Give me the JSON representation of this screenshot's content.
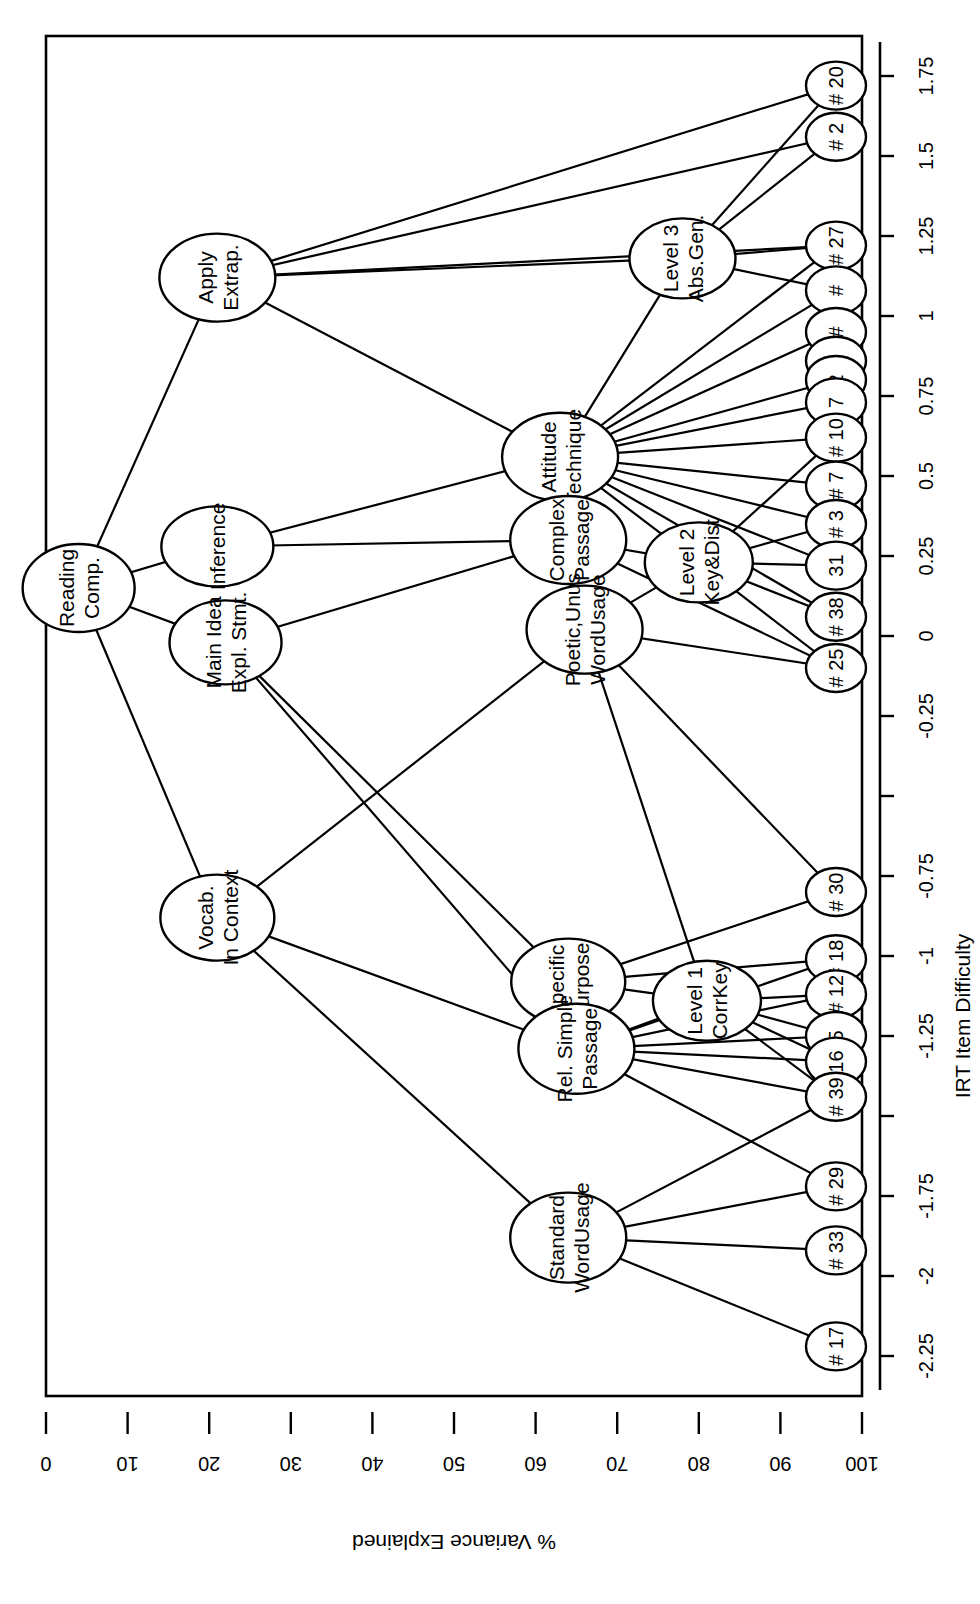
{
  "figure": {
    "orientation": "rotated-90-counterclockwise",
    "background": "#ffffff",
    "ink": "#000000"
  },
  "axes": {
    "x": {
      "label": "IRT Item Difficulty",
      "ticks": [
        "-2.25",
        "-2",
        "-1.75",
        "-1.5",
        "-1.25",
        "-1",
        "-0.75",
        "-0.5",
        "-0.25",
        "0",
        "0.25",
        "0.5",
        "0.75",
        "1",
        "1.25",
        "1.5",
        "1.75"
      ],
      "tick_labels_shown": [
        "-2.25",
        "-2",
        "-1.75",
        "-1.25",
        "-1",
        "-0.75",
        "-0.25",
        "0",
        "0.25",
        "0.5",
        "0.75",
        "1",
        "1.25",
        "1.5",
        "1.75"
      ],
      "min": -2.375,
      "max": 1.875
    },
    "y": {
      "label": "% Variance Explained",
      "ticks": [
        "0",
        "10",
        "20",
        "30",
        "40",
        "50",
        "60",
        "70",
        "80",
        "90",
        "100"
      ],
      "min": 0,
      "max": 100
    }
  },
  "chart_data": {
    "type": "diagram",
    "title": "",
    "xlabel": "IRT Item Difficulty",
    "ylabel": "% Variance Explained",
    "xlim": [
      -2.375,
      1.875
    ],
    "ylim": [
      0,
      100
    ],
    "grid": false,
    "legend": null,
    "nodes": [
      {
        "id": "root",
        "label": "Reading Comp.",
        "line1": "Reading",
        "line2": "Comp.",
        "x": 0.15,
        "y": 4,
        "rx": 44,
        "ry": 56,
        "kind": "construct"
      },
      {
        "id": "apply",
        "label": "Apply Extrap.",
        "line1": "Apply",
        "line2": "Extrap.",
        "x": 1.12,
        "y": 21,
        "rx": 44,
        "ry": 58,
        "kind": "construct"
      },
      {
        "id": "inference",
        "label": "Inference",
        "line1": "Inference",
        "line2": "",
        "x": 0.28,
        "y": 21,
        "rx": 40,
        "ry": 56,
        "kind": "construct"
      },
      {
        "id": "mainidea",
        "label": "Main Idea Expl. Stmt.",
        "line1": "Main Idea",
        "line2": "Expl. Stmt.",
        "x": -0.02,
        "y": 22,
        "rx": 42,
        "ry": 56,
        "kind": "construct"
      },
      {
        "id": "vocab",
        "label": "Vocab. In Context",
        "line1": "Vocab.",
        "line2": "In Context",
        "x": -0.88,
        "y": 21,
        "rx": 43,
        "ry": 57,
        "kind": "construct"
      },
      {
        "id": "attitude",
        "label": "Attitude Technique",
        "line1": "Attitude",
        "line2": "Technique",
        "x": 0.56,
        "y": 63,
        "rx": 44,
        "ry": 58,
        "kind": "facet"
      },
      {
        "id": "complexpass",
        "label": "Complex Passage",
        "line1": "Complex",
        "line2": "Passage",
        "x": 0.3,
        "y": 64,
        "rx": 44,
        "ry": 58,
        "kind": "facet"
      },
      {
        "id": "poetic",
        "label": "Poetic,Unus WordUsage",
        "line1": "Poetic,Unus",
        "line2": "WordUsage",
        "x": 0.02,
        "y": 66,
        "rx": 44,
        "ry": 58,
        "kind": "facet"
      },
      {
        "id": "specpurp",
        "label": "Specific Purpose",
        "line1": "Specific",
        "line2": "Purpose",
        "x": -1.08,
        "y": 64,
        "rx": 43,
        "ry": 57,
        "kind": "facet"
      },
      {
        "id": "relsimple",
        "label": "Rel. Simple Passage",
        "line1": "Rel. Simple",
        "line2": "Passage",
        "x": -1.29,
        "y": 65,
        "rx": 45,
        "ry": 58,
        "kind": "facet"
      },
      {
        "id": "stdword",
        "label": "Standard WordUsage",
        "line1": "Standard",
        "line2": "WordUsage",
        "x": -1.88,
        "y": 64,
        "rx": 45,
        "ry": 58,
        "kind": "facet"
      },
      {
        "id": "level3",
        "label": "Level 3 Abs.Gen.",
        "line1": "Level 3",
        "line2": "Abs.Gen.",
        "x": 1.18,
        "y": 78,
        "rx": 40,
        "ry": 53,
        "kind": "level"
      },
      {
        "id": "level2",
        "label": "Level 2 Key&Dist",
        "line1": "Level 2",
        "line2": "Key&Dist",
        "x": 0.23,
        "y": 80,
        "rx": 40,
        "ry": 54,
        "kind": "level"
      },
      {
        "id": "level1",
        "label": "Level 1 CorrKey",
        "line1": "Level 1",
        "line2": "CorrKey",
        "x": -1.14,
        "y": 81,
        "rx": 40,
        "ry": 54,
        "kind": "level"
      }
    ],
    "items": [
      {
        "id": "i20",
        "label": "# 20",
        "x": 1.72,
        "y": 100
      },
      {
        "id": "i2",
        "label": "# 2",
        "x": 1.56,
        "y": 100
      },
      {
        "id": "i27",
        "label": "# 27",
        "x": 1.22,
        "y": 100
      },
      {
        "id": "ix1",
        "label": "#",
        "x": 1.08,
        "y": 100
      },
      {
        "id": "ix2",
        "label": "#",
        "x": 0.95,
        "y": 100
      },
      {
        "id": "ix3",
        "label": "#",
        "x": 0.86,
        "y": 100
      },
      {
        "id": "i2b",
        "label": "2",
        "x": 0.8,
        "y": 100
      },
      {
        "id": "i7b",
        "label": "7",
        "x": 0.73,
        "y": 100
      },
      {
        "id": "i10",
        "label": "# 10",
        "x": 0.62,
        "y": 100
      },
      {
        "id": "i7",
        "label": "# 7",
        "x": 0.47,
        "y": 100
      },
      {
        "id": "i3",
        "label": "# 3",
        "x": 0.35,
        "y": 100
      },
      {
        "id": "i31",
        "label": "31",
        "x": 0.22,
        "y": 100
      },
      {
        "id": "i38",
        "label": "# 38",
        "x": 0.06,
        "y": 100
      },
      {
        "id": "i25",
        "label": "# 25",
        "x": -0.1,
        "y": 100
      },
      {
        "id": "i30",
        "label": "# 30",
        "x": -0.8,
        "y": 100
      },
      {
        "id": "i18",
        "label": "# 18",
        "x": -1.01,
        "y": 100
      },
      {
        "id": "i12",
        "label": "# 12",
        "x": -1.12,
        "y": 100
      },
      {
        "id": "i5",
        "label": "5",
        "x": -1.25,
        "y": 100
      },
      {
        "id": "i16",
        "label": "16",
        "x": -1.33,
        "y": 100
      },
      {
        "id": "i39",
        "label": "# 39",
        "x": -1.44,
        "y": 100
      },
      {
        "id": "i29",
        "label": "# 29",
        "x": -1.72,
        "y": 100
      },
      {
        "id": "i33",
        "label": "# 33",
        "x": -1.92,
        "y": 100
      },
      {
        "id": "i17",
        "label": "# 17",
        "x": -2.22,
        "y": 100
      }
    ],
    "edges": [
      [
        "root",
        "apply"
      ],
      [
        "root",
        "inference"
      ],
      [
        "root",
        "mainidea"
      ],
      [
        "root",
        "vocab"
      ],
      [
        "apply",
        "level3"
      ],
      [
        "apply",
        "i20"
      ],
      [
        "apply",
        "i2"
      ],
      [
        "apply",
        "i27"
      ],
      [
        "apply",
        "attitude"
      ],
      [
        "inference",
        "complexpass"
      ],
      [
        "inference",
        "attitude"
      ],
      [
        "mainidea",
        "complexpass"
      ],
      [
        "mainidea",
        "specpurp"
      ],
      [
        "mainidea",
        "relsimple"
      ],
      [
        "vocab",
        "poetic"
      ],
      [
        "vocab",
        "stdword"
      ],
      [
        "vocab",
        "relsimple"
      ],
      [
        "attitude",
        "i27"
      ],
      [
        "attitude",
        "ix1"
      ],
      [
        "attitude",
        "ix2"
      ],
      [
        "attitude",
        "i2b"
      ],
      [
        "attitude",
        "i7b"
      ],
      [
        "attitude",
        "i10"
      ],
      [
        "attitude",
        "i7"
      ],
      [
        "attitude",
        "i3"
      ],
      [
        "attitude",
        "i31"
      ],
      [
        "attitude",
        "i38"
      ],
      [
        "attitude",
        "level2"
      ],
      [
        "attitude",
        "level3"
      ],
      [
        "complexpass",
        "level2"
      ],
      [
        "complexpass",
        "i25"
      ],
      [
        "poetic",
        "level2"
      ],
      [
        "poetic",
        "i25"
      ],
      [
        "poetic",
        "i30"
      ],
      [
        "poetic",
        "level1"
      ],
      [
        "specpurp",
        "level1"
      ],
      [
        "specpurp",
        "i30"
      ],
      [
        "specpurp",
        "i18"
      ],
      [
        "relsimple",
        "level1"
      ],
      [
        "relsimple",
        "i18"
      ],
      [
        "relsimple",
        "i12"
      ],
      [
        "relsimple",
        "i5"
      ],
      [
        "relsimple",
        "i16"
      ],
      [
        "relsimple",
        "i39"
      ],
      [
        "relsimple",
        "i29"
      ],
      [
        "stdword",
        "i39"
      ],
      [
        "stdword",
        "i29"
      ],
      [
        "stdword",
        "i33"
      ],
      [
        "stdword",
        "i17"
      ],
      [
        "level1",
        "i12"
      ],
      [
        "level1",
        "i5"
      ],
      [
        "level1",
        "i16"
      ],
      [
        "level1",
        "i39"
      ],
      [
        "level2",
        "i3"
      ],
      [
        "level2",
        "i31"
      ],
      [
        "level2",
        "i38"
      ],
      [
        "level2",
        "i25"
      ],
      [
        "level2",
        "i10"
      ],
      [
        "level3",
        "i27"
      ],
      [
        "level3",
        "ix1"
      ],
      [
        "level3",
        "i2"
      ],
      [
        "level3",
        "i20"
      ]
    ]
  }
}
